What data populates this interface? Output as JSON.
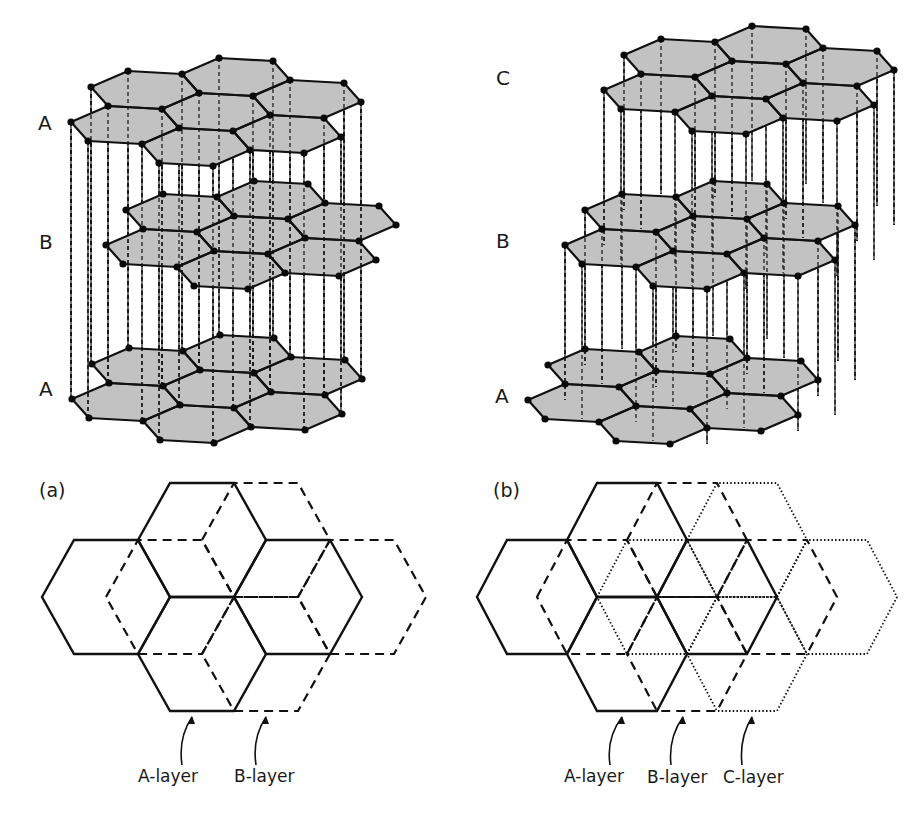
{
  "figure": {
    "description_title": "Graphite stacking: (a) ABAB hexagonal, (b) ABCABC rhombohedral",
    "colors": {
      "background": "#ffffff",
      "sheet_fill": "#c2c2c2",
      "line": "#111111",
      "atom": "#0a0a0a",
      "text": "#1a1a1a"
    }
  },
  "lattice3d": {
    "ex": [
      54,
      3
    ],
    "d": [
      10,
      -17.5
    ],
    "hex_positions": [
      [
        0,
        0
      ],
      [
        0,
        2
      ],
      [
        1,
        1
      ],
      [
        1,
        -1
      ],
      [
        1,
        3
      ],
      [
        2,
        0
      ],
      [
        2,
        2
      ]
    ],
    "atom_radius": 3.6
  },
  "panel_a_3d": {
    "layers": [
      {
        "id": "A-top",
        "label": "A",
        "origin": [
          125,
          125
        ],
        "label_pos": [
          38,
          113
        ]
      },
      {
        "id": "B",
        "label": "B",
        "origin": [
          160,
          248
        ],
        "label_pos": [
          39,
          232
        ]
      },
      {
        "id": "A-bottom",
        "label": "A",
        "origin": [
          126,
          402
        ],
        "label_pos": [
          39,
          379
        ]
      }
    ],
    "verticals": [
      {
        "from": 0,
        "to": 2
      }
    ]
  },
  "panel_b_3d": {
    "layers": [
      {
        "id": "C",
        "label": "C",
        "origin": [
          658,
          93
        ],
        "label_pos": [
          496,
          68
        ]
      },
      {
        "id": "B",
        "label": "B",
        "origin": [
          619,
          248
        ],
        "label_pos": [
          496,
          231
        ]
      },
      {
        "id": "A",
        "label": "A",
        "origin": [
          582,
          403
        ],
        "label_pos": [
          495,
          386
        ]
      }
    ],
    "verticals": [
      {
        "from": 0,
        "to": 1
      },
      {
        "from": 1,
        "to": 2
      }
    ]
  },
  "panel_a_2d": {
    "tag": "(a)",
    "tag_pos": [
      39,
      481
    ],
    "radius": 64,
    "half_height": 57,
    "hex_centers": [
      [
        106,
        597
      ],
      [
        202,
        540
      ],
      [
        202,
        654
      ],
      [
        298,
        597
      ]
    ],
    "layers": [
      {
        "name": "A-layer",
        "style": "solid",
        "shift": 0
      },
      {
        "name": "B-layer",
        "style": "dashed",
        "shift": 64
      }
    ],
    "callouts": [
      {
        "label": "A-layer",
        "text_pos": [
          138,
          768
        ],
        "arrow": [
          [
            182,
            765
          ],
          [
            178,
            738
          ],
          [
            192,
            717
          ]
        ]
      },
      {
        "label": "B-layer",
        "text_pos": [
          234,
          768
        ],
        "arrow": [
          [
            256,
            765
          ],
          [
            252,
            738
          ],
          [
            266,
            717
          ]
        ]
      }
    ]
  },
  "panel_b_2d": {
    "tag": "(b)",
    "tag_pos": [
      493,
      481
    ],
    "radius": 60,
    "half_height": 57,
    "hex_centers": [
      [
        537,
        597
      ],
      [
        627,
        540
      ],
      [
        627,
        654
      ],
      [
        717,
        597
      ]
    ],
    "layers": [
      {
        "name": "A-layer",
        "style": "solid",
        "shift": 0
      },
      {
        "name": "B-layer",
        "style": "dashed",
        "shift": 60
      },
      {
        "name": "C-layer",
        "style": "dotted",
        "shift": 120
      }
    ],
    "callouts": [
      {
        "label": "A-layer",
        "text_pos": [
          564,
          768
        ],
        "arrow": [
          [
            610,
            765
          ],
          [
            606,
            738
          ],
          [
            622,
            717
          ]
        ]
      },
      {
        "label": "B-layer",
        "text_pos": [
          647,
          769
        ],
        "arrow": [
          [
            671,
            765
          ],
          [
            668,
            738
          ],
          [
            683,
            717
          ]
        ]
      },
      {
        "label": "C-layer",
        "text_pos": [
          723,
          769
        ],
        "arrow": [
          [
            742,
            765
          ],
          [
            739,
            738
          ],
          [
            752,
            717
          ]
        ]
      }
    ]
  }
}
